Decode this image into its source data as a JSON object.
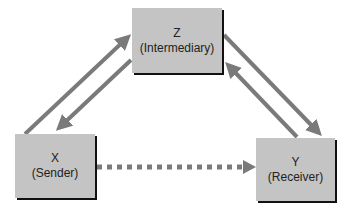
{
  "nodes": {
    "z": {
      "letter": "Z",
      "role": "(Intermediary)"
    },
    "x": {
      "letter": "X",
      "role": "(Sender)"
    },
    "y": {
      "letter": "Y",
      "role": "(Receiver)"
    }
  },
  "edges": [
    {
      "from": "X",
      "to": "Z",
      "style": "solid"
    },
    {
      "from": "Z",
      "to": "X",
      "style": "solid"
    },
    {
      "from": "Z",
      "to": "Y",
      "style": "solid"
    },
    {
      "from": "Y",
      "to": "Z",
      "style": "solid"
    },
    {
      "from": "X",
      "to": "Y",
      "style": "dotted"
    }
  ],
  "colors": {
    "node_fill": "#c4c4c4",
    "arrow": "#7a7a7a",
    "shadow": "#111111"
  }
}
